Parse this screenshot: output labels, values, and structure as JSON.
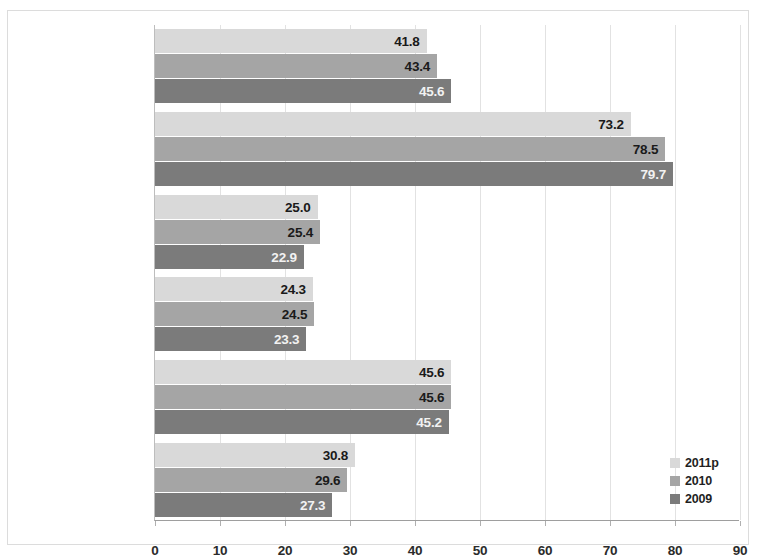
{
  "chart_data": {
    "type": "bar",
    "orientation": "horizontal",
    "title": "",
    "subtitle": "",
    "xlabel": "",
    "ylabel": "",
    "xlim": [
      0,
      90
    ],
    "xticks": [
      "0",
      "10",
      "20",
      "30",
      "40",
      "50",
      "60",
      "70",
      "80",
      "90"
    ],
    "grid": true,
    "legend_position": "bottom-right",
    "categories": [
      "Panamá (SPNF)",
      "Nicargua (SPNF)",
      "Honduras (SPNF)",
      "Guatemala (GC)",
      "El Salvador (GC)",
      "Costa Rica (GC)"
    ],
    "series": [
      {
        "name": "2011p",
        "color": "#d9d9d9",
        "label_color": "#1a1a1a",
        "values": [
          41.8,
          73.2,
          25.0,
          24.3,
          45.6,
          30.8
        ],
        "labels": [
          "41.8",
          "73.2",
          "25.0",
          "24.3",
          "45.6",
          "30.8"
        ]
      },
      {
        "name": "2010",
        "color": "#a5a5a5",
        "label_color": "#1a1a1a",
        "values": [
          43.4,
          78.5,
          25.4,
          24.5,
          45.6,
          29.6
        ],
        "labels": [
          "43.4",
          "78.5",
          "25.4",
          "24.5",
          "45.6",
          "29.6"
        ]
      },
      {
        "name": "2009",
        "color": "#7b7b7b",
        "label_color": "#f2f2f2",
        "values": [
          45.6,
          79.7,
          22.9,
          23.3,
          45.2,
          27.3
        ],
        "labels": [
          "45.6",
          "79.7",
          "22.9",
          "23.3",
          "45.2",
          "27.3"
        ]
      }
    ],
    "legend": [
      {
        "label": "2011p",
        "color": "#d9d9d9"
      },
      {
        "label": "2010",
        "color": "#a5a5a5"
      },
      {
        "label": "2009",
        "color": "#7b7b7b"
      }
    ]
  }
}
